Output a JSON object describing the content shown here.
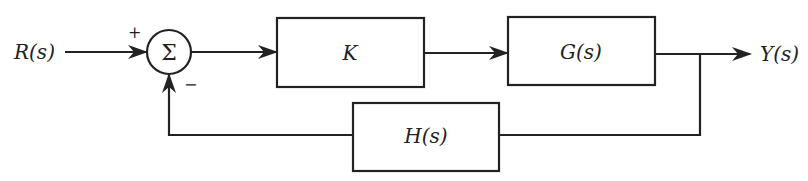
{
  "diagram": {
    "type": "feedback-control-block-diagram",
    "input": {
      "label": "R(s)"
    },
    "output": {
      "label": "Y(s)"
    },
    "summing_junction": {
      "symbol": "Σ",
      "plus_sign": "+",
      "minus_sign": "−"
    },
    "blocks": [
      {
        "id": "controller",
        "label": "K"
      },
      {
        "id": "plant",
        "label": "G(s)"
      },
      {
        "id": "feedback",
        "label": "H(s)"
      }
    ],
    "connections": [
      {
        "from": "R(s)",
        "to": "summing_junction",
        "sign": "+"
      },
      {
        "from": "summing_junction",
        "to": "K"
      },
      {
        "from": "K",
        "to": "G(s)"
      },
      {
        "from": "G(s)",
        "to": "Y(s)"
      },
      {
        "from": "G(s) output",
        "to": "H(s)"
      },
      {
        "from": "H(s)",
        "to": "summing_junction",
        "sign": "−"
      }
    ],
    "colors": {
      "stroke": "#222222",
      "background": "#ffffff"
    }
  }
}
